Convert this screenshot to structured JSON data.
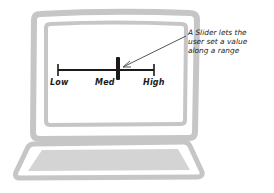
{
  "illustration": {
    "subject": "laptop",
    "colors": {
      "frame": "#c6c6c6",
      "keyboard": "#d4d4d4",
      "ink": "#1a1a1a",
      "arrow": "#555555",
      "background": "#ffffff"
    }
  },
  "slider": {
    "labels": {
      "low": "Low",
      "med": "Med",
      "high": "High"
    },
    "value": "Med"
  },
  "annotation": {
    "lines": [
      "A Slider lets the",
      "user set a value",
      "along a range"
    ]
  }
}
